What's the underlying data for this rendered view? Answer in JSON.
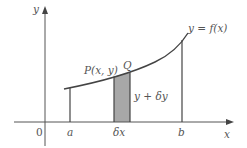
{
  "diagram": {
    "axes": {
      "y_label": "y",
      "x_label": "x",
      "origin_label": "0"
    },
    "curve": {
      "label": "y = f(x)"
    },
    "points": {
      "P_label": "P(x, y)",
      "Q_label": "Q"
    },
    "bounds": {
      "a_label": "a",
      "b_label": "b"
    },
    "strip": {
      "width_label": "δx",
      "height_label": "y + δy",
      "fill_color": "#9a9a9a"
    },
    "colors": {
      "stroke": "#444444",
      "text": "#555555"
    }
  }
}
